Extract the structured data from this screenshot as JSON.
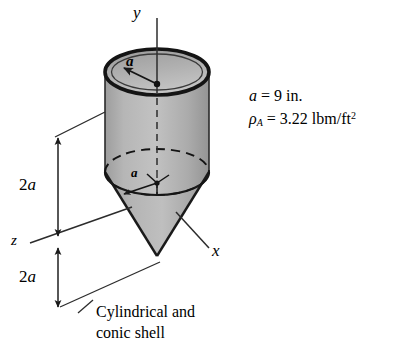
{
  "figure": {
    "kind": "engineering-solid-diagram",
    "background_color": "#ffffff",
    "line_color": "#1a1a1a",
    "shade_color": "#a8a8a8",
    "axes": {
      "y_label": "y",
      "x_label": "x",
      "z_label": "z"
    },
    "radius_labels": {
      "top_circle": "a",
      "mid_circle": "a"
    },
    "dimensions": {
      "upper": {
        "value": "2a",
        "number": "2",
        "symbol": "a"
      },
      "lower": {
        "value": "2a",
        "number": "2",
        "symbol": "a"
      }
    },
    "properties": {
      "radius_line": {
        "symbol": "a",
        "equals": "=",
        "value": "9",
        "unit": "in."
      },
      "density_line": {
        "symbol": "ρ",
        "subscript": "A",
        "equals": "=",
        "value": "3.22",
        "unit": "lbm/ft",
        "unit_exponent": "2"
      }
    },
    "caption": {
      "line1": "Cylindrical and",
      "line2": "conic shell"
    }
  }
}
